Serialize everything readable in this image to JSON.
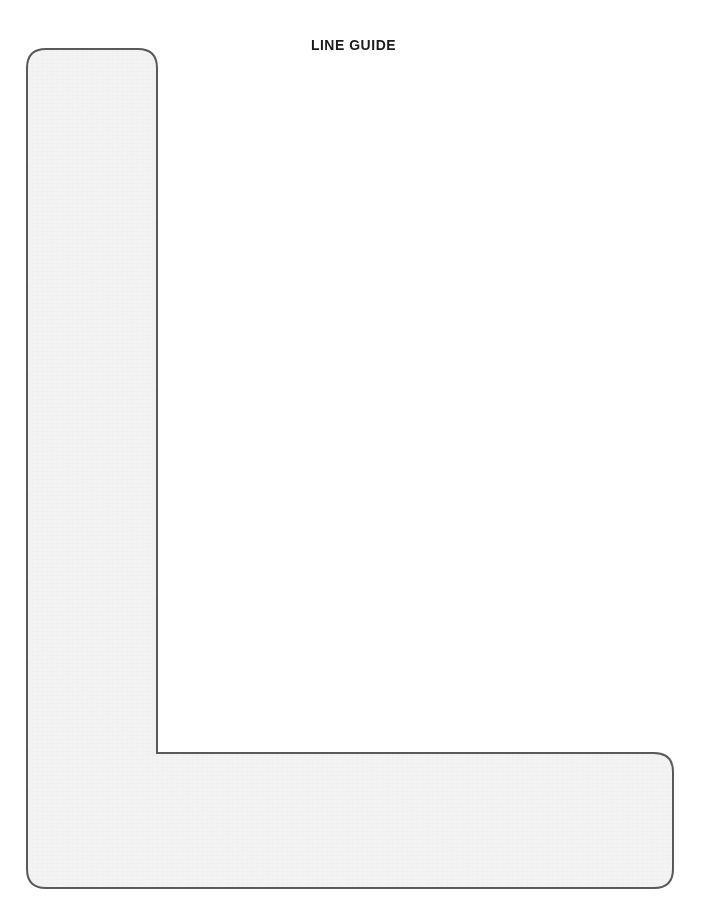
{
  "page": {
    "background_color": "#ffffff",
    "width": 707,
    "height": 916
  },
  "figure": {
    "title": "LINE GUIDE",
    "shape_name": "L-shaped line guide",
    "shape_label": "line-guide-l-shape",
    "fill_color": "#f3f3f3",
    "stroke_color": "#5a5a5a",
    "stroke_width_px": 2,
    "corner_radius_px": 19,
    "geometry": {
      "outer_left_x": 27,
      "outer_top_y": 49,
      "outer_right_x": 673,
      "outer_bottom_y": 888,
      "vertical_arm_right_x": 157,
      "horizontal_arm_top_y": 753,
      "vertical_arm_width": 130,
      "horizontal_arm_height": 135,
      "inner_corner_x": 157,
      "inner_corner_y": 753,
      "inner_corner_style": "sharp"
    }
  },
  "caption": {
    "remnant_text": ""
  }
}
